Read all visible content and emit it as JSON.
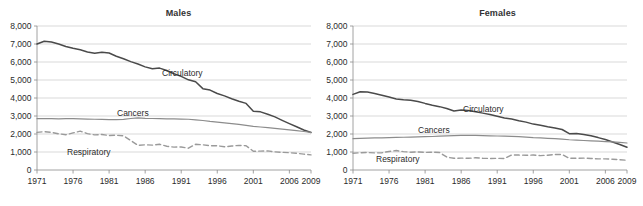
{
  "figure": {
    "width": 643,
    "height": 206,
    "background": "#ffffff"
  },
  "panels": [
    {
      "id": "males",
      "title": "Males"
    },
    {
      "id": "females",
      "title": "Females"
    }
  ],
  "axis": {
    "y_ticks": [
      "0",
      "1,000",
      "2,000",
      "3,000",
      "4,000",
      "5,000",
      "6,000",
      "7,000",
      "8,000"
    ],
    "x_ticks": [
      "1971",
      "1976",
      "1981",
      "1986",
      "1991",
      "1996",
      "2001",
      "2006",
      "2009"
    ]
  },
  "series_labels": {
    "circulatory": "Circulatory",
    "cancers": "Cancers",
    "respiratory": "Respiratory"
  },
  "colors": {
    "circulatory": "#4a4a4a",
    "cancers": "#8c8c8c",
    "respiratory": "#9a9a9a",
    "gridline": "#c8c8c8",
    "axis": "#8a8a8a",
    "text": "#2b2b2b",
    "title": "#333333"
  },
  "chart_data": [
    {
      "type": "line",
      "title": "Males",
      "xlabel": "",
      "ylabel": "",
      "xlim": [
        1971,
        2009
      ],
      "ylim": [
        0,
        8000
      ],
      "grid": true,
      "legend": "inline-annotations",
      "xtick_labels": [
        "1971",
        "1976",
        "1981",
        "1986",
        "1991",
        "1996",
        "2001",
        "2006",
        "2009"
      ],
      "ytick_labels": [
        "0",
        "1,000",
        "2,000",
        "3,000",
        "4,000",
        "5,000",
        "6,000",
        "7,000",
        "8,000"
      ],
      "x": [
        1971,
        1972,
        1973,
        1974,
        1975,
        1976,
        1977,
        1978,
        1979,
        1980,
        1981,
        1982,
        1983,
        1984,
        1985,
        1986,
        1987,
        1988,
        1989,
        1990,
        1991,
        1992,
        1993,
        1994,
        1995,
        1996,
        1997,
        1998,
        1999,
        2000,
        2001,
        2002,
        2003,
        2004,
        2005,
        2006,
        2007,
        2008,
        2009
      ],
      "series": [
        {
          "name": "Circulatory",
          "style": "solid",
          "color": "#4a4a4a",
          "values": [
            7000,
            7150,
            7110,
            7000,
            6860,
            6760,
            6680,
            6560,
            6480,
            6540,
            6500,
            6320,
            6180,
            6020,
            5890,
            5730,
            5620,
            5660,
            5530,
            5350,
            5200,
            5010,
            4900,
            4520,
            4440,
            4250,
            4120,
            3960,
            3820,
            3700,
            3260,
            3230,
            3100,
            2950,
            2760,
            2580,
            2400,
            2220,
            2080
          ]
        },
        {
          "name": "Cancers",
          "style": "solid",
          "color": "#8c8c8c",
          "values": [
            2850,
            2860,
            2850,
            2840,
            2850,
            2850,
            2840,
            2830,
            2820,
            2810,
            2800,
            2800,
            2810,
            2860,
            2900,
            2870,
            2860,
            2850,
            2840,
            2840,
            2830,
            2820,
            2790,
            2750,
            2700,
            2660,
            2620,
            2580,
            2530,
            2480,
            2420,
            2390,
            2350,
            2310,
            2270,
            2230,
            2190,
            2140,
            2090
          ]
        },
        {
          "name": "Respiratory",
          "style": "dashed",
          "color": "#9a9a9a",
          "values": [
            2090,
            2130,
            2090,
            2010,
            1960,
            2060,
            2160,
            2020,
            1950,
            1970,
            1920,
            1930,
            1900,
            1640,
            1370,
            1400,
            1380,
            1430,
            1320,
            1270,
            1280,
            1210,
            1430,
            1400,
            1350,
            1350,
            1290,
            1330,
            1370,
            1350,
            1040,
            1050,
            1060,
            1010,
            980,
            960,
            930,
            880,
            840
          ]
        }
      ]
    },
    {
      "type": "line",
      "title": "Females",
      "xlabel": "",
      "ylabel": "",
      "xlim": [
        1971,
        2009
      ],
      "ylim": [
        0,
        8000
      ],
      "grid": true,
      "legend": "inline-annotations",
      "xtick_labels": [
        "1971",
        "1976",
        "1981",
        "1986",
        "1991",
        "1996",
        "2001",
        "2006",
        "2009"
      ],
      "ytick_labels": [
        "0",
        "1,000",
        "2,000",
        "3,000",
        "4,000",
        "5,000",
        "6,000",
        "7,000",
        "8,000"
      ],
      "x": [
        1971,
        1972,
        1973,
        1974,
        1975,
        1976,
        1977,
        1978,
        1979,
        1980,
        1981,
        1982,
        1983,
        1984,
        1985,
        1986,
        1987,
        1988,
        1989,
        1990,
        1991,
        1992,
        1993,
        1994,
        1995,
        1996,
        1997,
        1998,
        1999,
        2000,
        2001,
        2002,
        2003,
        2004,
        2005,
        2006,
        2007,
        2008,
        2009
      ],
      "series": [
        {
          "name": "Circulatory",
          "style": "solid",
          "color": "#4a4a4a",
          "values": [
            4200,
            4350,
            4330,
            4250,
            4150,
            4050,
            3950,
            3900,
            3870,
            3810,
            3700,
            3600,
            3520,
            3420,
            3280,
            3330,
            3300,
            3230,
            3160,
            3080,
            2990,
            2890,
            2830,
            2740,
            2660,
            2550,
            2480,
            2400,
            2330,
            2250,
            2020,
            2030,
            1970,
            1900,
            1800,
            1690,
            1560,
            1420,
            1260
          ]
        },
        {
          "name": "Cancers",
          "style": "solid",
          "color": "#8c8c8c",
          "values": [
            1740,
            1760,
            1770,
            1780,
            1790,
            1800,
            1810,
            1820,
            1830,
            1840,
            1850,
            1860,
            1880,
            1900,
            1910,
            1920,
            1920,
            1920,
            1910,
            1900,
            1890,
            1880,
            1870,
            1850,
            1830,
            1800,
            1780,
            1760,
            1740,
            1710,
            1680,
            1660,
            1640,
            1620,
            1600,
            1580,
            1560,
            1530,
            1500
          ]
        },
        {
          "name": "Respiratory",
          "style": "dashed",
          "color": "#9a9a9a",
          "values": [
            930,
            960,
            970,
            950,
            960,
            1030,
            1080,
            1020,
            990,
            1000,
            980,
            990,
            970,
            720,
            650,
            660,
            650,
            680,
            650,
            640,
            650,
            640,
            830,
            830,
            820,
            830,
            800,
            820,
            860,
            860,
            650,
            650,
            660,
            640,
            620,
            620,
            600,
            570,
            540
          ]
        }
      ]
    }
  ]
}
